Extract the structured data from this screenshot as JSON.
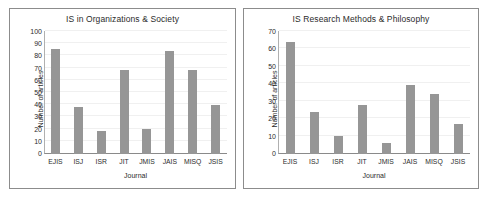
{
  "chart_data": [
    {
      "type": "bar",
      "title": "IS in Organizations & Society",
      "xlabel": "Journal",
      "ylabel": "Number of articles",
      "categories": [
        "EJIS",
        "ISJ",
        "ISR",
        "JIT",
        "JMIS",
        "JAIS",
        "MISQ",
        "JSIS"
      ],
      "values": [
        85,
        38,
        19,
        68,
        20,
        84,
        68,
        40
      ],
      "ylim": [
        0,
        100
      ],
      "yticks": [
        0,
        10,
        20,
        30,
        40,
        50,
        60,
        70,
        80,
        90,
        100
      ],
      "grid": true,
      "legend": "none",
      "bar_color": "#969696"
    },
    {
      "type": "bar",
      "title": "IS Research Methods & Philosophy",
      "xlabel": "Journal",
      "ylabel": "Number of articles",
      "categories": [
        "EJIS",
        "ISJ",
        "ISR",
        "JIT",
        "JMIS",
        "JAIS",
        "MISQ",
        "JSIS"
      ],
      "values": [
        64,
        24,
        10,
        28,
        6,
        39,
        34,
        17
      ],
      "ylim": [
        0,
        70
      ],
      "yticks": [
        0,
        10,
        20,
        30,
        40,
        50,
        60,
        70
      ],
      "grid": true,
      "legend": "none",
      "bar_color": "#969696"
    }
  ]
}
